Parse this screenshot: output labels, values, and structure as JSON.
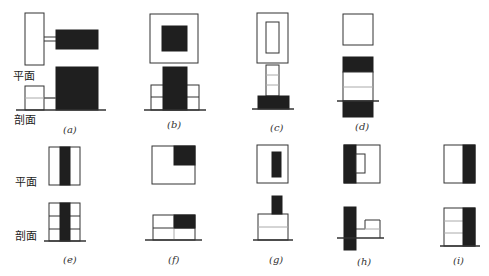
{
  "row_labels": {
    "top_plan": "平面",
    "top_section": "剖面",
    "bottom_plan": "平面",
    "bottom_section": "剖面"
  },
  "captions": {
    "a": "(a)",
    "b": "(b)",
    "c": "(c)",
    "d": "(d)",
    "e": "(e)",
    "f": "(f)",
    "g": "(g)",
    "h": "(h)",
    "i": "(i)"
  },
  "colors": {
    "line": "#333333",
    "fill": "#1f1f1f",
    "light_line": "#aaaaaa"
  }
}
